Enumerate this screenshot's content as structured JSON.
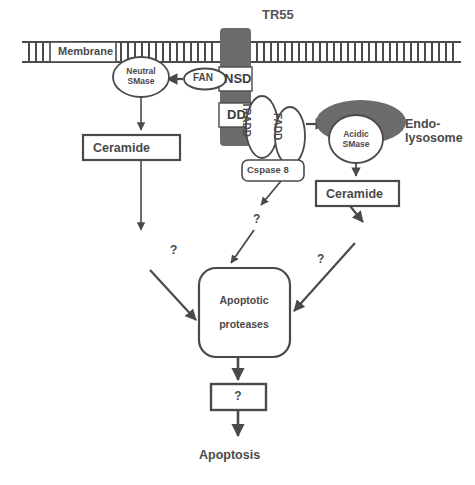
{
  "diagram": {
    "title": "TR55",
    "type": "signal-transduction-pathway",
    "membrane_label": "Membrane",
    "receptor": {
      "name": "TR55",
      "domains": [
        {
          "id": "nsd",
          "label": "NSD"
        },
        {
          "id": "dd",
          "label": "DD"
        }
      ]
    },
    "adaptors": [
      {
        "id": "fan",
        "label": "FAN"
      },
      {
        "id": "tradd",
        "label": "TRADD"
      },
      {
        "id": "fadd",
        "label": "FADD"
      }
    ],
    "enzymes": [
      {
        "id": "neutral-smase",
        "line1": "Neutral",
        "line2": "SMase"
      },
      {
        "id": "acidic-smase",
        "line1": "Acidic",
        "line2": "SMase"
      }
    ],
    "organelle": {
      "id": "endolysosome",
      "line1": "Endo-",
      "line2": "lysosome"
    },
    "boxes": [
      {
        "id": "cspase8",
        "label": "Cspase 8"
      },
      {
        "id": "ceramide-left",
        "label": "Ceramide"
      },
      {
        "id": "ceramide-right",
        "label": "Ceramide"
      },
      {
        "id": "apoptotic-proteases",
        "line1": "Apoptotic",
        "line2": "proteases"
      },
      {
        "id": "unknown-step",
        "label": "?"
      }
    ],
    "outcome": "Apoptosis",
    "unknown_markers": [
      {
        "id": "q-left",
        "label": "?"
      },
      {
        "id": "q-mid",
        "label": "?"
      },
      {
        "id": "q-right",
        "label": "?"
      }
    ],
    "colors": {
      "receptor_fill": "#6b6b6b",
      "organelle_fill": "#6b6b6b",
      "stroke": "#4a4a4a",
      "text": "#4a4a4a",
      "background": "#ffffff"
    }
  }
}
